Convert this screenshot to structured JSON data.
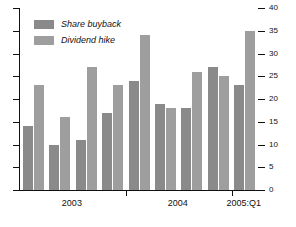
{
  "chart_data": {
    "type": "bar",
    "title": "",
    "subtitle": "",
    "xlabel": "",
    "ylabel": "",
    "ylim": [
      0,
      40
    ],
    "yticks": [
      0,
      5,
      10,
      15,
      20,
      25,
      30,
      35,
      40
    ],
    "ytick_labels": [
      "0",
      "5",
      "10",
      "15",
      "20",
      "25",
      "30",
      "35",
      "40"
    ],
    "y_axis_position": "right",
    "grid": false,
    "legend_position": "top-left",
    "categories": [
      "2003:Q1",
      "2003:Q2",
      "2003:Q3",
      "2003:Q4",
      "2004:Q1",
      "2004:Q2",
      "2004:Q3",
      "2004:Q4",
      "2005:Q1"
    ],
    "xtick_labels": [
      "2003",
      "2004",
      "2005:Q1"
    ],
    "series": [
      {
        "name": "Share buyback",
        "color": "#8a8a8a",
        "values": [
          14,
          10,
          11,
          17,
          24,
          19,
          18,
          27,
          23
        ]
      },
      {
        "name": "Dividend hike",
        "color": "#9e9e9e",
        "values": [
          23,
          16,
          27,
          23,
          34,
          18,
          26,
          25,
          35
        ]
      }
    ]
  },
  "legend": {
    "items": [
      {
        "label": "Share buyback"
      },
      {
        "label": "Dividend hike"
      }
    ]
  },
  "axis": {
    "right_tick_labels": [
      "40",
      "35",
      "30",
      "25",
      "20",
      "15",
      "10",
      "5",
      "0"
    ],
    "x_group_labels": [
      "2003",
      "2004",
      "2005:Q1"
    ]
  }
}
